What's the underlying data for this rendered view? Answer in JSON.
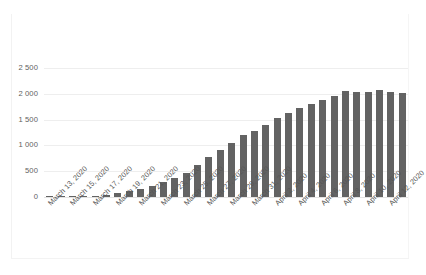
{
  "chart_data": {
    "type": "bar",
    "title": "",
    "subtitle": "",
    "xlabel": "",
    "ylabel": "",
    "ylim": [
      0,
      2500
    ],
    "yticks": [
      0,
      500,
      1000,
      1500,
      2000,
      2500
    ],
    "ytick_labels": [
      "0",
      "500",
      "1 000",
      "1 500",
      "2 000",
      "2 500"
    ],
    "grid": true,
    "legend": null,
    "legend_position": "none",
    "bar_color": "#636363",
    "gridline_color": "#eeeeee",
    "categories": [
      "March 13, 2020",
      "March 14, 2020",
      "March 15, 2020",
      "March 16, 2020",
      "March 17, 2020",
      "March 18, 2020",
      "March 19, 2020",
      "March 20, 2020",
      "March 21, 2020",
      "March 22, 2020",
      "March 23, 2020",
      "March 24, 2020",
      "March 25, 2020",
      "March 26, 2020",
      "March 27, 2020",
      "March 28, 2020",
      "March 29, 2020",
      "March 30, 2020",
      "March 31, 2020",
      "April 1, 2020",
      "April 2, 2020",
      "April 3, 2020",
      "April 4, 2020",
      "April 5, 2020",
      "April 6, 2020",
      "April 7, 2020",
      "April 8, 2020",
      "April 9, 2020",
      "April 10, 2020",
      "April 11, 2020",
      "April 12, 2020",
      "April 13, 2020"
    ],
    "values": [
      2,
      5,
      9,
      15,
      28,
      45,
      70,
      110,
      155,
      215,
      290,
      360,
      465,
      625,
      775,
      920,
      1040,
      1195,
      1280,
      1400,
      1530,
      1620,
      1720,
      1810,
      1880,
      1950,
      2045,
      2040,
      2030,
      2070,
      2040,
      2010
    ],
    "xtick_labels": [
      "March 13, 2020",
      "March 15, 2020",
      "March 17, 2020",
      "March 19, 2020",
      "March 21, 2020",
      "March 23, 2020",
      "March 25, 2020",
      "March 27, 2020",
      "March 29, 2020",
      "March 31, 2020",
      "April 2, 2020",
      "April 4, 2020",
      "April 6, 2020",
      "April 8, 2020",
      "April 10, 2020",
      "April 12, 2020"
    ],
    "xtick_indices": [
      0,
      2,
      4,
      6,
      8,
      10,
      12,
      14,
      16,
      18,
      20,
      22,
      24,
      26,
      28,
      30
    ]
  },
  "caption": {
    "text": ""
  }
}
